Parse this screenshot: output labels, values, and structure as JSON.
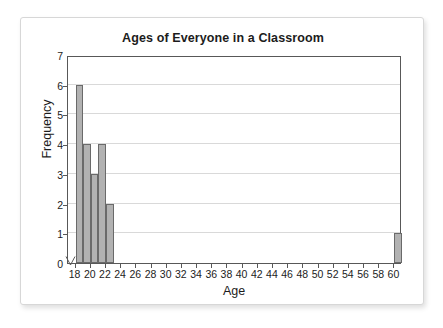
{
  "figure": {
    "title": "Ages of Everyone in a Classroom",
    "xlabel": "Age",
    "ylabel": "Frequency",
    "axis_break_icon": "axis-break-mark",
    "colors": {
      "bar_fill": "#b2b2b2",
      "bar_stroke": "#6a6a6a",
      "axis": "#585858",
      "gridline": "#d9d9d9",
      "text": "#1c1c1c",
      "card_border": "#d7d7d7",
      "background": "#ffffff"
    }
  },
  "chart_data": {
    "type": "bar",
    "title": "Ages of Everyone in a Classroom",
    "subtitle": "",
    "xlabel": "Age",
    "ylabel": "Frequency",
    "xlim": [
      17,
      61
    ],
    "ylim": [
      0,
      7
    ],
    "grid": true,
    "legend": null,
    "xticks": [
      18,
      20,
      22,
      24,
      26,
      28,
      30,
      32,
      34,
      36,
      38,
      40,
      42,
      44,
      46,
      48,
      50,
      52,
      54,
      56,
      58,
      60
    ],
    "xtick_labels": [
      "18",
      "20",
      "22",
      "24",
      "26",
      "28",
      "30",
      "32",
      "34",
      "36",
      "38",
      "40",
      "42",
      "44",
      "46",
      "48",
      "50",
      "52",
      "54",
      "56",
      "58",
      "60"
    ],
    "yticks": [
      0,
      1,
      2,
      3,
      4,
      5,
      6,
      7
    ],
    "ytick_labels": [
      "0",
      "1",
      "2",
      "3",
      "4",
      "5",
      "6",
      "7"
    ],
    "bin_width": 1,
    "categories": [
      "18",
      "19",
      "20",
      "21",
      "22",
      "60"
    ],
    "values": [
      6,
      4,
      3,
      4,
      2,
      1
    ],
    "bars": [
      {
        "label": "18",
        "x_start": 18,
        "x_end": 19,
        "value": 6
      },
      {
        "label": "19",
        "x_start": 19,
        "x_end": 20,
        "value": 4
      },
      {
        "label": "20",
        "x_start": 20,
        "x_end": 21,
        "value": 3
      },
      {
        "label": "21",
        "x_start": 21,
        "x_end": 22,
        "value": 4
      },
      {
        "label": "22",
        "x_start": 22,
        "x_end": 23,
        "value": 2
      },
      {
        "label": "60",
        "x_start": 60,
        "x_end": 61,
        "value": 1
      }
    ]
  }
}
